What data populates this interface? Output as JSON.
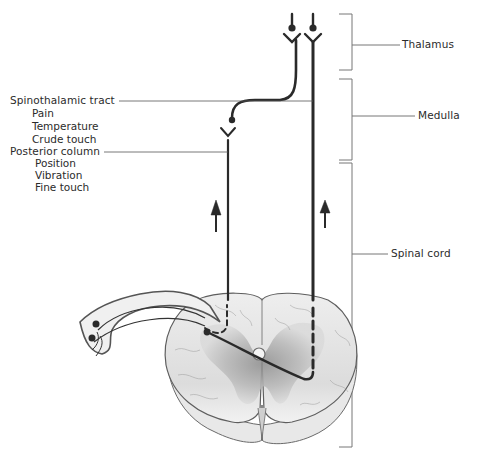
{
  "diagram": {
    "regions": [
      {
        "id": "thalamus",
        "label": "Thalamus"
      },
      {
        "id": "medulla",
        "label": "Medulla"
      },
      {
        "id": "spinal_cord",
        "label": "Spinal cord"
      }
    ],
    "tracts": [
      {
        "id": "spinothalamic",
        "label": "Spinothalamic tract",
        "modalities": [
          "Pain",
          "Temperature",
          "Crude touch"
        ]
      },
      {
        "id": "posterior_column",
        "label": "Posterior column",
        "modalities": [
          "Position",
          "Vibration",
          "Fine touch"
        ]
      }
    ],
    "direction_arrows": [
      "up-arrow",
      "up-arrow"
    ],
    "colors": {
      "pathway": "#2a2a2a",
      "leader_line": "#555555",
      "bracket": "#777777",
      "cord_light": "#e6e6e6",
      "cord_dark": "#9a9a9a"
    }
  }
}
